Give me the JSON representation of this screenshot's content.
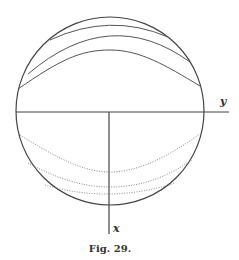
{
  "figure": {
    "caption": "Fig. 29.",
    "axis_labels": {
      "horizontal": "y",
      "vertical": "x"
    },
    "colors": {
      "line": "#444444",
      "dotted": "#777777",
      "background": "#ffffff"
    }
  }
}
